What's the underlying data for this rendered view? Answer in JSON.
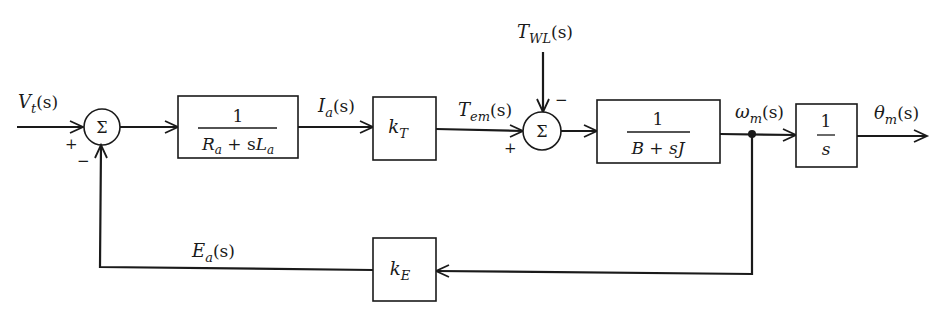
{
  "diagram": {
    "type": "block-diagram",
    "input": {
      "label": "V",
      "sub": "t",
      "arg": "(s)"
    },
    "summing_junctions": [
      {
        "id": "sum1",
        "symbol": "Σ",
        "signs": {
          "left": "+",
          "bottom": "−"
        }
      },
      {
        "id": "sum2",
        "symbol": "Σ",
        "signs": {
          "left": "+",
          "top": "−"
        }
      }
    ],
    "blocks": [
      {
        "id": "armature",
        "numerator": "1",
        "denominator": {
          "parts": [
            "R",
            "a",
            " + s",
            "L",
            "a"
          ]
        }
      },
      {
        "id": "torque_const",
        "symbol": "k",
        "sub": "T"
      },
      {
        "id": "mechanical",
        "numerator": "1",
        "denominator": "B + sJ"
      },
      {
        "id": "integrator",
        "numerator": "1",
        "denominator": "s"
      },
      {
        "id": "back_emf_const",
        "symbol": "k",
        "sub": "E"
      }
    ],
    "signals": {
      "armature_current": {
        "label": "I",
        "sub": "a",
        "arg": "(s)"
      },
      "electromagnetic_torque": {
        "label": "T",
        "sub": "em",
        "arg": "(s)"
      },
      "load_torque": {
        "label": "T",
        "sub": "WL",
        "arg": "(s)"
      },
      "angular_speed": {
        "label": "ω",
        "sub": "m",
        "arg": "(s)"
      },
      "angular_position": {
        "label": "θ",
        "sub": "m",
        "arg": "(s)"
      },
      "back_emf": {
        "label": "E",
        "sub": "a",
        "arg": "(s)"
      }
    },
    "signs": {
      "plus": "+",
      "minus": "−"
    }
  }
}
